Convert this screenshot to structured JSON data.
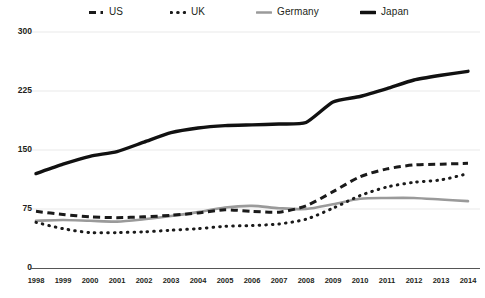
{
  "chart_data": {
    "type": "line",
    "title": "",
    "subtitle": "",
    "xlabel": "",
    "ylabel": "",
    "x": [
      1998,
      1999,
      2000,
      2001,
      2002,
      2003,
      2004,
      2005,
      2006,
      2007,
      2008,
      2009,
      2010,
      2011,
      2012,
      2013,
      2014
    ],
    "xtick_labels": [
      "1998",
      "1999",
      "2000",
      "2001",
      "2002",
      "2003",
      "2004",
      "2005",
      "2006",
      "2007",
      "2008",
      "2009",
      "2010",
      "2011",
      "2012",
      "2013",
      "2014"
    ],
    "ytick_labels": [
      "0",
      "75",
      "150",
      "225",
      "300"
    ],
    "yticks": [
      0,
      75,
      150,
      225,
      300
    ],
    "ylim": [
      0,
      300
    ],
    "xlim": [
      1998,
      2014
    ],
    "grid": "horizontal",
    "legend_position": "top",
    "series": [
      {
        "name": "US",
        "style": "dashed",
        "color": "#1a1a1a",
        "values": [
          72,
          68,
          65,
          64,
          65,
          67,
          70,
          74,
          72,
          71,
          79,
          97,
          116,
          126,
          131,
          132,
          133
        ]
      },
      {
        "name": "UK",
        "style": "dotted",
        "color": "#1a1a1a",
        "values": [
          58,
          50,
          45,
          45,
          46,
          48,
          50,
          53,
          54,
          56,
          62,
          76,
          92,
          103,
          109,
          112,
          120
        ]
      },
      {
        "name": "Germany",
        "style": "solid",
        "color": "#9a9a9a",
        "values": [
          60,
          61,
          60,
          59,
          62,
          66,
          71,
          77,
          79,
          76,
          75,
          81,
          88,
          89,
          89,
          87,
          85
        ]
      },
      {
        "name": "Japan",
        "style": "solid-bold",
        "color": "#111111",
        "values": [
          120,
          132,
          142,
          148,
          160,
          172,
          178,
          181,
          182,
          183,
          185,
          211,
          218,
          228,
          239,
          245,
          250
        ]
      }
    ]
  },
  "legend": {
    "items": [
      {
        "label": "US",
        "style": "dashed",
        "color": "#1a1a1a"
      },
      {
        "label": "UK",
        "style": "dotted",
        "color": "#1a1a1a"
      },
      {
        "label": "Germany",
        "style": "solid",
        "color": "#9a9a9a"
      },
      {
        "label": "Japan",
        "style": "solid-bold",
        "color": "#111111"
      }
    ]
  },
  "axes": {
    "gridline_color": "#e9e9e9",
    "axis_color": "#555555",
    "background": "#ffffff"
  }
}
